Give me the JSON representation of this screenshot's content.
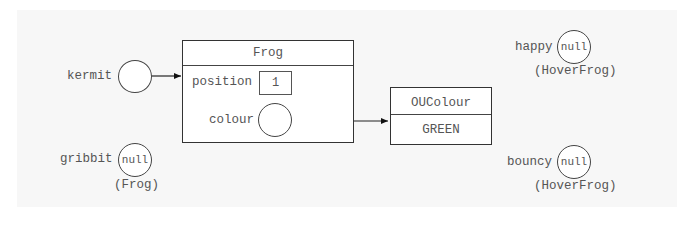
{
  "diagram": {
    "type": "object-reference-diagram",
    "background_color": "#f7f7f7",
    "variables": [
      {
        "name": "kermit",
        "value": "",
        "type_label": "",
        "refers_to": "Frog"
      },
      {
        "name": "gribbit",
        "value": "null",
        "type_label": "(Frog)"
      },
      {
        "name": "happy",
        "value": "null",
        "type_label": "(HoverFrog)"
      },
      {
        "name": "bouncy",
        "value": "null",
        "type_label": "(HoverFrog)"
      }
    ],
    "objects": [
      {
        "class_name": "Frog",
        "fields": [
          {
            "name": "position",
            "value": "1"
          },
          {
            "name": "colour",
            "value": "",
            "refers_to": "OUColour"
          }
        ]
      },
      {
        "class_name": "OUColour",
        "value": "GREEN"
      }
    ]
  }
}
